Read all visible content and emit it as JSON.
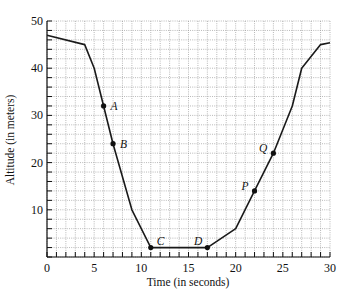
{
  "chart_data": {
    "type": "line",
    "title": "",
    "xlabel": "Time (in seconds)",
    "ylabel": "Altitude (in meters)",
    "xlim": [
      0,
      30
    ],
    "ylim": [
      0,
      50
    ],
    "x_ticks": [
      0,
      5,
      10,
      15,
      20,
      25,
      30
    ],
    "y_ticks": [
      10,
      20,
      30,
      40,
      50
    ],
    "x_minor_step": 1,
    "y_minor_step": 2,
    "grid": true,
    "legend": null,
    "series": [
      {
        "name": "Altitude",
        "x": [
          0,
          4,
          5,
          6,
          7,
          9,
          11,
          17,
          20,
          22,
          24,
          26,
          27,
          29,
          30
        ],
        "y": [
          47,
          45,
          40,
          32,
          24,
          10,
          2,
          2,
          6,
          14,
          22,
          32,
          40,
          45,
          45.4
        ]
      }
    ],
    "annotations": [
      {
        "label": "A",
        "x": 6,
        "y": 32,
        "pos": "right"
      },
      {
        "label": "B",
        "x": 7,
        "y": 24,
        "pos": "right"
      },
      {
        "label": "C",
        "x": 11,
        "y": 2,
        "pos": "upper-right"
      },
      {
        "label": "D",
        "x": 17,
        "y": 2,
        "pos": "upper-left"
      },
      {
        "label": "P",
        "x": 22,
        "y": 14,
        "pos": "left"
      },
      {
        "label": "Q",
        "x": 24,
        "y": 22,
        "pos": "left"
      }
    ]
  },
  "colors": {
    "line": "#1a1a1a",
    "grid": "#8a8a8a",
    "background": "#ffffff"
  }
}
